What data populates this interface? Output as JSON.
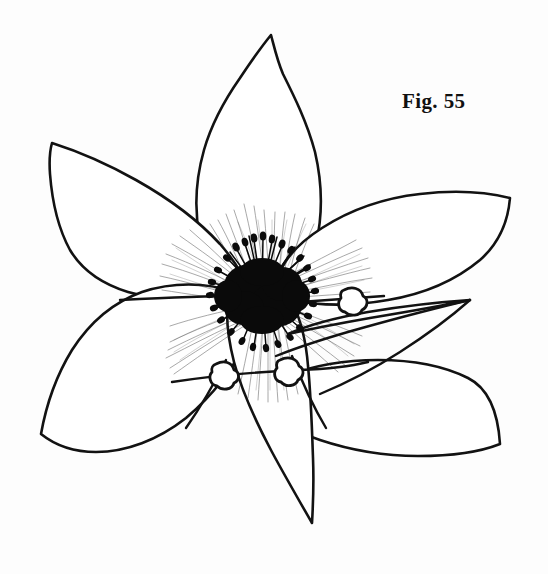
{
  "figure": {
    "caption": "Fig. 55",
    "title": "Fig. 55",
    "medium": "pen-and-ink botanical illustration",
    "background_color": "#fdfdfd",
    "ink_color": "#121212",
    "canvas": {
      "width": 548,
      "height": 574
    }
  },
  "drawing": {
    "type": "botanical-line-drawing",
    "description": "Six-petaled clematis-like flower drawn in pen and ink, viewed face-on, with a dense dark mass of radiating stamens at the center, fine hatch shading along the petal bases, a narrow lance-shaped blade crossing the lower right petal, and two small lobed bract nodes on the lower stems.",
    "parts": {
      "petals": [
        {
          "name": "top-petal",
          "tip": [
            271,
            35
          ],
          "shape": "pointed teardrop",
          "hatched": true
        },
        {
          "name": "upper-left-petal",
          "tip": [
            52,
            143
          ],
          "shape": "narrow lanceolate",
          "hatched": true
        },
        {
          "name": "lower-left-petal",
          "tip": [
            41,
            434
          ],
          "shape": "broad rounded ovate",
          "hatched": true
        },
        {
          "name": "right-petal",
          "tip": [
            510,
            198
          ],
          "shape": "broad pointed ovate",
          "hatched": true
        },
        {
          "name": "lower-right-petal",
          "tip": [
            500,
            444
          ],
          "shape": "broad angular ovate",
          "hatched": true
        },
        {
          "name": "bottom-petal",
          "tip": [
            312,
            523
          ],
          "shape": "narrow pointed V",
          "hatched": true
        }
      ],
      "center": {
        "name": "stamen-cluster",
        "position": [
          262,
          295
        ],
        "description": "dense dark mass of radiating stamen filaments with bulbous anther tips",
        "color": "#0a0a0a"
      },
      "blade": {
        "name": "lance-blade",
        "tip": [
          470,
          300
        ],
        "description": "narrow elongated lance-shaped leaf crossing over the right petal"
      },
      "bracts": [
        {
          "name": "bract-node-left",
          "position": [
            224,
            375
          ]
        },
        {
          "name": "bract-node-right",
          "position": [
            288,
            371
          ]
        },
        {
          "name": "bract-node-upper-right",
          "position": [
            352,
            300
          ]
        }
      ]
    }
  }
}
